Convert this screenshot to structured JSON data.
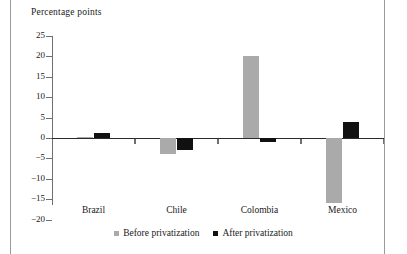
{
  "chart_data": {
    "type": "bar",
    "title": "Percentage points",
    "xlabel": "",
    "ylabel": "Percentage points",
    "categories": [
      "Brazil",
      "Chile",
      "Colombia",
      "Mexico"
    ],
    "series": [
      {
        "name": "Before privatization",
        "color": "#aaaaaa",
        "values": [
          0.3,
          -4,
          20,
          -16
        ]
      },
      {
        "name": "After privatization",
        "color": "#111111",
        "values": [
          1.3,
          -3,
          -1,
          4
        ]
      }
    ],
    "ylim": [
      -20,
      25
    ],
    "yticks": [
      25,
      20,
      15,
      10,
      5,
      0,
      "−5",
      "−10",
      "−15",
      "−20"
    ],
    "grid": false,
    "legend_position": "bottom"
  },
  "legend": {
    "before_label": "Before privatization",
    "after_label": "After privatization"
  }
}
